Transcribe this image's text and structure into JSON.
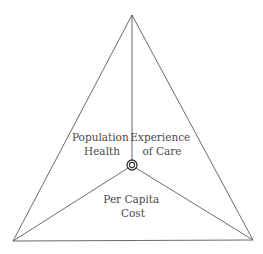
{
  "diagram": {
    "type": "triangle-framework",
    "colors": {
      "line": "#5a5a5a",
      "text": "#4a4a4a",
      "background": "#ffffff"
    },
    "regions": [
      {
        "id": "population-health",
        "lines": [
          "Population",
          "Health"
        ]
      },
      {
        "id": "experience-of-care",
        "lines": [
          "Experience",
          "of Care"
        ]
      },
      {
        "id": "per-capita-cost",
        "lines": [
          "Per Capita",
          "Cost"
        ]
      }
    ],
    "center_marker": "target-icon"
  }
}
